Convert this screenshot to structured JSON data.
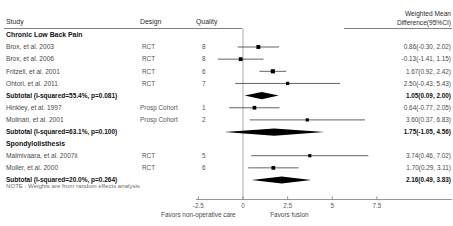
{
  "header": {
    "study": "Study",
    "design": "Design",
    "quality": "Quality",
    "effect_line1": "Weighted Mean",
    "effect_line2": "Difference(95%CI)"
  },
  "note": "NOTE : Weights are from random effects analysis",
  "axis": {
    "ticks": [
      -2.5,
      0,
      2.5,
      5,
      7.5
    ],
    "tick_labels": [
      "-2.5",
      "0",
      "2.5",
      "5",
      "7.5"
    ],
    "left_label": "Favors non-operative care",
    "right_label": "Favors fusion",
    "null_line": 0,
    "xmin": -4.4,
    "xmax": 9.5
  },
  "groups": [
    {
      "label": "Chronic Low Back Pain",
      "rows": [
        {
          "study": "Brox, et al. 2003",
          "design": "RCT",
          "quality": "8",
          "est": 0.86,
          "lo": -0.3,
          "hi": 2.02,
          "ci_text": "0.86(-0.30, 2.02)",
          "weight": 0.62,
          "type": "study"
        },
        {
          "study": "Brox, et al. 2006",
          "design": "RCT",
          "quality": "8",
          "est": -0.13,
          "lo": -1.41,
          "hi": 1.15,
          "ci_text": "-0.13(-1.41, 1.15)",
          "weight": 0.6,
          "type": "study"
        },
        {
          "study": "Fritzell, et al. 2001",
          "design": "RCT",
          "quality": "6",
          "est": 1.67,
          "lo": 0.92,
          "hi": 2.42,
          "ci_text": "1.67(0.92, 2.42)",
          "weight": 0.72,
          "type": "study"
        },
        {
          "study": "Ohtori, et al. 2011",
          "design": "RCT",
          "quality": "7",
          "est": 2.5,
          "lo": -0.43,
          "hi": 5.43,
          "ci_text": "2.50(-0.43, 5.43)",
          "weight": 0.42,
          "type": "study"
        },
        {
          "study": "Subtotal  (I-squared=55.4%,  p=0.081)",
          "design": "",
          "quality": "",
          "est": 1.05,
          "lo": 0.09,
          "hi": 2.0,
          "ci_text": "1.05(0.09, 2.00)",
          "type": "subtotal"
        },
        {
          "study": "Hinkley, et al. 1997",
          "design": "Prosp Cohort",
          "quality": "1",
          "est": 0.64,
          "lo": -0.77,
          "hi": 2.05,
          "ci_text": "0.64(-0.77, 2.05)",
          "weight": 0.56,
          "type": "study"
        },
        {
          "study": "Molinari, et al. 2001",
          "design": "Prosp Cohort",
          "quality": "2",
          "est": 3.6,
          "lo": 0.37,
          "hi": 6.83,
          "ci_text": "3.60(0.37, 6.83)",
          "weight": 0.4,
          "type": "study"
        },
        {
          "study": "Subtotal  (I-squared=63.1%,  p=0.100)",
          "design": "",
          "quality": "",
          "est": 1.75,
          "lo": -1.05,
          "hi": 4.56,
          "ci_text": "1.75(-1.05, 4.56)",
          "type": "subtotal"
        }
      ]
    },
    {
      "label": "Spondylolisthesis",
      "rows": [
        {
          "study": "Malmivaara, et al. 2007ii",
          "design": "RCT",
          "quality": "5",
          "est": 3.74,
          "lo": 0.46,
          "hi": 7.02,
          "ci_text": "3.74(0.46, 7.02)",
          "weight": 0.38,
          "type": "study"
        },
        {
          "study": "Moller, et al. 2000",
          "design": "RCT",
          "quality": "6",
          "est": 1.7,
          "lo": 0.29,
          "hi": 3.11,
          "ci_text": "1.70(0.29, 3.11)",
          "weight": 0.58,
          "type": "study"
        },
        {
          "study": "Subtotal  (I-squared=20.0%,  p=0.264)",
          "design": "",
          "quality": "",
          "est": 2.16,
          "lo": 0.49,
          "hi": 3.83,
          "ci_text": "2.16(0.49, 3.83)",
          "type": "subtotal"
        }
      ]
    }
  ],
  "chart_data": {
    "type": "forest",
    "title": "",
    "xlabel": "Weighted Mean Difference",
    "xlim": [
      -4.4,
      9.5
    ],
    "null_value": 0,
    "categories": [
      "Brox, et al. 2003",
      "Brox, et al. 2006",
      "Fritzell, et al. 2001",
      "Ohtori, et al. 2011",
      "Subtotal (I-squared=55.4%, p=0.081)",
      "Hinkley, et al. 1997",
      "Molinari, et al. 2001",
      "Subtotal (I-squared=63.1%, p=0.100)",
      "Malmivaara, et al. 2007ii",
      "Moller, et al. 2000",
      "Subtotal (I-squared=20.0%, p=0.264)"
    ],
    "estimates": [
      0.86,
      -0.13,
      1.67,
      2.5,
      1.05,
      0.64,
      3.6,
      1.75,
      3.74,
      1.7,
      2.16
    ],
    "ci_low": [
      -0.3,
      -1.41,
      0.92,
      -0.43,
      0.09,
      -0.77,
      0.37,
      -1.05,
      0.46,
      0.29,
      0.49
    ],
    "ci_high": [
      2.02,
      1.15,
      2.42,
      5.43,
      2.0,
      2.05,
      6.83,
      4.56,
      7.02,
      3.11,
      3.83
    ],
    "ticks": [
      -2.5,
      0,
      2.5,
      5,
      7.5
    ],
    "grid": false,
    "legend": "none"
  }
}
